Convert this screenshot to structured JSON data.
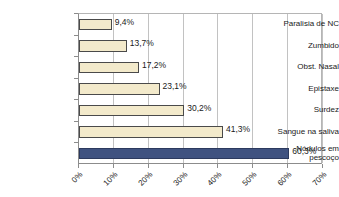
{
  "chart_data": {
    "type": "bar",
    "orientation": "horizontal",
    "title": "",
    "subtitle": "",
    "xlabel": "",
    "ylabel": "",
    "xlim": [
      0,
      70
    ],
    "xtick_labels": [
      "0%",
      "10%",
      "20%",
      "30%",
      "40%",
      "50%",
      "60%",
      "70%"
    ],
    "xtick_values": [
      0,
      10,
      20,
      30,
      40,
      50,
      60,
      70
    ],
    "grid": true,
    "grid_axis": "x",
    "legend": false,
    "categories": [
      "Paralisia de NC",
      "Zumbido",
      "Obst. Nasal",
      "Epistaxe",
      "Surdez",
      "Sangue na saliva",
      "Nódulos em\npescoço"
    ],
    "values": [
      9.4,
      13.7,
      17.2,
      23.1,
      30.2,
      41.3,
      60.3
    ],
    "value_labels": [
      "9,4%",
      "13,7%",
      "17,2%",
      "23,1%",
      "30,2%",
      "41,3%",
      "60,3%"
    ],
    "bar_colors": [
      "#f3eacb",
      "#f3eacb",
      "#f3eacb",
      "#f3eacb",
      "#f3eacb",
      "#f3eacb",
      "#3f5280"
    ],
    "colors": {
      "bar_cream": "#f3eacb",
      "bar_navy": "#3f5280",
      "bar_border": "#4a4a4a",
      "gridline": "#c2c2c2",
      "axis": "#8c8c8c",
      "text": "#1a1a1a",
      "background": "#ffffff"
    }
  }
}
